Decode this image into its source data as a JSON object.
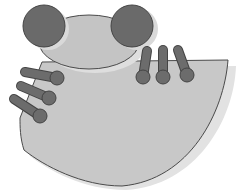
{
  "image": {
    "subject": "Grayscale clipart of a frog-like figure with two round eyes, a head, a fan-shaped body and finger-like toes",
    "colors": {
      "background": "#ffffff",
      "body_fill": "#c8c8c8",
      "head_fill": "#c4c4c4",
      "eye_fill": "#6a6a6a",
      "toe_fill": "#6c6c6c",
      "outline": "#4a4a4a",
      "shadow": "#e2e2e2"
    },
    "parts": {
      "eyes": [
        {
          "name": "left-eye",
          "cx": 44,
          "cy": 26,
          "r": 21
        },
        {
          "name": "right-eye",
          "cx": 132,
          "cy": 26,
          "r": 21
        }
      ],
      "head": {
        "cx": 89,
        "cy": 42,
        "rx": 50,
        "ry": 27
      },
      "right_toes": [
        {
          "x1": 147,
          "y1": 51,
          "x2": 143,
          "y2": 77
        },
        {
          "x1": 163,
          "y1": 50,
          "x2": 163,
          "y2": 77
        },
        {
          "x1": 178,
          "y1": 50,
          "x2": 187,
          "y2": 75
        }
      ],
      "left_toes": [
        {
          "x1": 25,
          "y1": 72,
          "x2": 57,
          "y2": 78
        },
        {
          "x1": 21,
          "y1": 86,
          "x2": 49,
          "y2": 98
        },
        {
          "x1": 14,
          "y1": 99,
          "x2": 40,
          "y2": 116
        }
      ]
    }
  }
}
